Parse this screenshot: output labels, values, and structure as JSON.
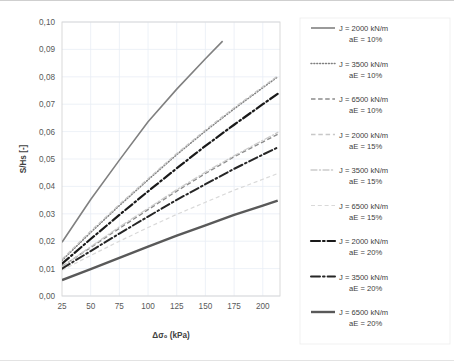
{
  "chart_data": {
    "type": "line",
    "title": "",
    "xlabel": "Δσ₀ (kPa)",
    "ylabel": "S/Hs [-]",
    "xlim": [
      25,
      215
    ],
    "ylim": [
      0.0,
      0.1
    ],
    "grid": true,
    "legend_position": "right",
    "xticks": [
      25,
      50,
      75,
      100,
      125,
      150,
      175,
      200
    ],
    "xtick_labels": [
      "25",
      "50",
      "75",
      "100",
      "125",
      "150",
      "175",
      "200"
    ],
    "yticks": [
      0.0,
      0.01,
      0.02,
      0.03,
      0.04,
      0.05,
      0.06,
      0.07,
      0.08,
      0.09,
      0.1
    ],
    "ytick_labels": [
      "0,00",
      "0,01",
      "0,02",
      "0,03",
      "0,04",
      "0,05",
      "0,06",
      "0,07",
      "0,08",
      "0,09",
      "0,10"
    ],
    "series": [
      {
        "name": "J = 2000 kN/m aE = 10%",
        "J": "2000 kN/m",
        "aE": "10%",
        "style": "solid",
        "color": "#808080",
        "width": 1.6,
        "x": [
          25,
          50,
          75,
          100,
          125,
          150,
          165
        ],
        "values": [
          0.0196,
          0.0352,
          0.0496,
          0.0636,
          0.0755,
          0.0866,
          0.093
        ]
      },
      {
        "name": "J = 3500 kN/m aE = 10%",
        "J": "3500 kN/m",
        "aE": "10%",
        "style": "dotted",
        "color": "#7f7f7f",
        "width": 1.5,
        "x": [
          25,
          50,
          75,
          100,
          125,
          150,
          175,
          200,
          213
        ],
        "values": [
          0.013,
          0.0232,
          0.033,
          0.0424,
          0.0516,
          0.0602,
          0.0683,
          0.076,
          0.08
        ]
      },
      {
        "name": "J = 6500 kN/m aE = 10%",
        "J": "6500 kN/m",
        "aE": "10%",
        "style": "dashed",
        "color": "#8c8c8c",
        "width": 1.4,
        "x": [
          25,
          50,
          75,
          100,
          125,
          150,
          175,
          200,
          213
        ],
        "values": [
          0.0108,
          0.0177,
          0.0247,
          0.0315,
          0.0383,
          0.0447,
          0.0508,
          0.0562,
          0.059
        ]
      },
      {
        "name": "J = 2000 kN/m aE = 15%",
        "J": "2000 kN/m",
        "aE": "15%",
        "style": "dashed-light",
        "color": "#c8c8c8",
        "width": 1.3,
        "x": [
          25,
          50,
          75,
          100,
          125,
          150,
          175,
          200,
          213
        ],
        "values": [
          0.0134,
          0.0237,
          0.0334,
          0.0428,
          0.052,
          0.0606,
          0.0687,
          0.0764,
          0.0803
        ]
      },
      {
        "name": "J = 3500 kN/m aE = 15%",
        "J": "3500 kN/m",
        "aE": "15%",
        "style": "dashdot-light",
        "color": "#cccccc",
        "width": 1.3,
        "x": [
          25,
          50,
          75,
          100,
          125,
          150,
          175,
          200,
          213
        ],
        "values": [
          0.0106,
          0.018,
          0.0252,
          0.032,
          0.0388,
          0.0452,
          0.0512,
          0.0568,
          0.0597
        ]
      },
      {
        "name": "J = 6500 kN/m aE = 15%",
        "J": "6500 kN/m",
        "aE": "15%",
        "style": "dashed-verylight",
        "color": "#d9d9d9",
        "width": 1.2,
        "x": [
          25,
          50,
          75,
          100,
          125,
          150,
          175,
          200,
          213
        ],
        "values": [
          0.0094,
          0.0148,
          0.02,
          0.025,
          0.0298,
          0.0342,
          0.0386,
          0.0426,
          0.0447
        ]
      },
      {
        "name": "J = 2000 kN/m aE = 20%",
        "J": "2000 kN/m",
        "aE": "20%",
        "style": "bold-dashdot",
        "color": "#1a1a1a",
        "width": 2.2,
        "x": [
          25,
          50,
          75,
          100,
          125,
          150,
          175,
          200,
          213
        ],
        "values": [
          0.0118,
          0.0208,
          0.0296,
          0.0382,
          0.0466,
          0.0548,
          0.0625,
          0.07,
          0.0738
        ]
      },
      {
        "name": "J = 3500 kN/m aE = 20%",
        "J": "3500 kN/m",
        "aE": "20%",
        "style": "bold-dashdot",
        "color": "#262626",
        "width": 2.0,
        "x": [
          25,
          50,
          75,
          100,
          125,
          150,
          175,
          200,
          213
        ],
        "values": [
          0.01,
          0.0164,
          0.0228,
          0.029,
          0.0351,
          0.0408,
          0.0464,
          0.0516,
          0.0542
        ]
      },
      {
        "name": "J = 6500 kN/m aE = 20%",
        "J": "6500 kN/m",
        "aE": "20%",
        "style": "bold-solid",
        "color": "#595959",
        "width": 2.4,
        "x": [
          25,
          50,
          75,
          100,
          125,
          150,
          175,
          200,
          213
        ],
        "values": [
          0.0058,
          0.0098,
          0.0139,
          0.018,
          0.022,
          0.0258,
          0.0296,
          0.033,
          0.0348
        ]
      }
    ]
  },
  "legend": {
    "items": [
      {
        "line1": "J = 2000 kN/m",
        "line2": "aE = 10%"
      },
      {
        "line1": "J = 3500 kN/m",
        "line2": "aE = 10%"
      },
      {
        "line1": "J = 6500 kN/m",
        "line2": "aE = 10%"
      },
      {
        "line1": "J = 2000 kN/m",
        "line2": "aE = 15%"
      },
      {
        "line1": "J = 3500 kN/m",
        "line2": "aE = 15%"
      },
      {
        "line1": "J = 6500 kN/m",
        "line2": "aE = 15%"
      },
      {
        "line1": "J = 2000 kN/m",
        "line2": "aE = 20%"
      },
      {
        "line1": "J = 3500 kN/m",
        "line2": "aE = 20%"
      },
      {
        "line1": "J = 6500 kN/m",
        "line2": "aE = 20%"
      }
    ]
  },
  "colors": {
    "grid": "#e8eef5",
    "frame": "#d6d6d6",
    "text": "#404040",
    "background": "#ffffff"
  }
}
